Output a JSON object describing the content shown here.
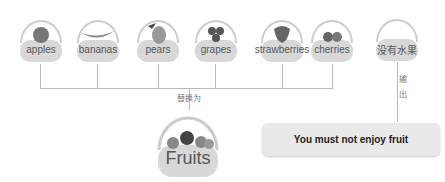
{
  "diagram": {
    "inputs": [
      {
        "label": "apples",
        "icon": "apple-icon"
      },
      {
        "label": "bananas",
        "icon": "banana-icon"
      },
      {
        "label": "pears",
        "icon": "pear-icon"
      },
      {
        "label": "grapes",
        "icon": "grapes-icon"
      },
      {
        "label": "strawberries",
        "icon": "strawberry-icon"
      },
      {
        "label": "cherries",
        "icon": "cherry-icon"
      }
    ],
    "no_fruit": {
      "label": "没有水果"
    },
    "replace_label": "替换为",
    "output_label_1": "输",
    "output_label_2": "出",
    "fruits_basket": {
      "label": "Fruits"
    },
    "result": {
      "text": "You must not enjoy fruit"
    }
  },
  "colors": {
    "line": "#b9b9b9",
    "basket_fill": "#d8d8d8",
    "result_box": "#e9e9e9"
  }
}
